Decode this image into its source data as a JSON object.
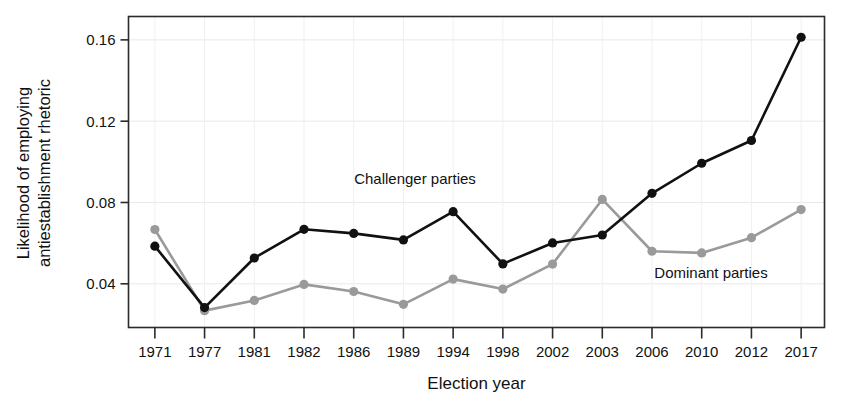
{
  "chart_data": {
    "type": "line",
    "title": "",
    "xlabel": "Election year",
    "ylabel": "Likelihood of employing antiestablishment rhetoric",
    "ylabel_line1": "Likelihood of employing",
    "ylabel_line2": "antiestablishment rhetoric",
    "categories": [
      "1971",
      "1977",
      "1981",
      "1982",
      "1986",
      "1989",
      "1994",
      "1998",
      "2002",
      "2003",
      "2006",
      "2010",
      "2012",
      "2017"
    ],
    "xticklabels": [
      "1971",
      "1977",
      "1981",
      "1982",
      "1986",
      "1989",
      "1994",
      "1998",
      "2002",
      "2003",
      "2006",
      "2010",
      "2012",
      "2017"
    ],
    "yticklabels": [
      "0.04",
      "0.08",
      "0.12",
      "0.16"
    ],
    "yticks": [
      0.04,
      0.08,
      0.12,
      0.16
    ],
    "ylim": [
      0.0185,
      0.1715
    ],
    "grid": true,
    "legend_position": "inline-annotation",
    "series": [
      {
        "name": "Challenger parties",
        "color": "#111111",
        "marker": "circle",
        "values": [
          0.0585,
          0.0283,
          0.0527,
          0.0668,
          0.0648,
          0.0616,
          0.0755,
          0.0498,
          0.0601,
          0.064,
          0.0845,
          0.0993,
          0.1105,
          0.1613
        ]
      },
      {
        "name": "Dominant parties",
        "color": "#9a9a9a",
        "marker": "circle",
        "values": [
          0.0667,
          0.0268,
          0.0318,
          0.0397,
          0.0362,
          0.0299,
          0.0423,
          0.0374,
          0.0497,
          0.0815,
          0.056,
          0.0552,
          0.0627,
          0.0765
        ]
      }
    ],
    "annotations": [
      {
        "text": "Challenger parties",
        "series": "Challenger parties",
        "x_px": 415,
        "y_px": 184
      },
      {
        "text": "Dominant parties",
        "series": "Dominant parties",
        "x_px": 711,
        "y_px": 278
      }
    ]
  }
}
